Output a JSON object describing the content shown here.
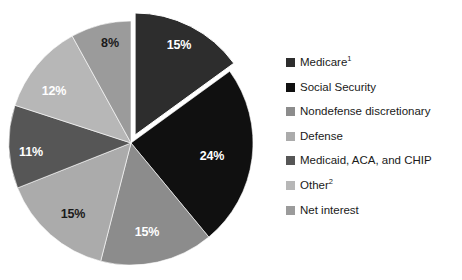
{
  "chart_data": {
    "type": "pie",
    "title": "",
    "subtitle": "",
    "xlabel": "",
    "ylabel": "",
    "legend_position": "right",
    "grid": false,
    "unit": "percent",
    "total": 100,
    "exploded_slices": [
      "Medicare"
    ],
    "categories": [
      "Medicare",
      "Social Security",
      "Nondefense discretionary",
      "Defense",
      "Medicaid, ACA, and CHIP",
      "Other",
      "Net interest"
    ],
    "values": [
      15,
      24,
      15,
      15,
      11,
      12,
      8
    ],
    "data_labels": [
      "15%",
      "24%",
      "15%",
      "15%",
      "11%",
      "12%",
      "8%"
    ],
    "colors": [
      "#2d2d2d",
      "#101010",
      "#8c8c8c",
      "#ababab",
      "#565656",
      "#b7b7b7",
      "#9b9b9b"
    ],
    "label_text_colors": [
      "#ffffff",
      "#ffffff",
      "#ffffff",
      "#1a1a1a",
      "#ffffff",
      "#ffffff",
      "#1a1a1a"
    ],
    "slices": [
      {
        "name": "Medicare",
        "legend_label": "Medicare",
        "footnote_marker": "1",
        "value": 15,
        "data_label": "15%",
        "color": "#2d2d2d",
        "label_color": "#ffffff",
        "exploded": true,
        "label_x": 179,
        "label_y": 46
      },
      {
        "name": "Social Security",
        "legend_label": "Social Security",
        "footnote_marker": "",
        "value": 24,
        "data_label": "24%",
        "color": "#101010",
        "label_color": "#ffffff",
        "exploded": false,
        "label_x": 212,
        "label_y": 157
      },
      {
        "name": "Nondefense discretionary",
        "legend_label": "Nondefense discretionary",
        "footnote_marker": "",
        "value": 15,
        "data_label": "15%",
        "color": "#8c8c8c",
        "label_color": "#ffffff",
        "exploded": false,
        "label_x": 147,
        "label_y": 233
      },
      {
        "name": "Defense",
        "legend_label": "Defense",
        "footnote_marker": "",
        "value": 15,
        "data_label": "15%",
        "color": "#ababab",
        "label_color": "#1a1a1a",
        "exploded": false,
        "label_x": 73,
        "label_y": 215
      },
      {
        "name": "Medicaid, ACA, and CHIP",
        "legend_label": "Medicaid, ACA, and CHIP",
        "footnote_marker": "",
        "value": 11,
        "data_label": "11%",
        "color": "#565656",
        "label_color": "#ffffff",
        "exploded": false,
        "label_x": 31,
        "label_y": 153
      },
      {
        "name": "Other",
        "legend_label": "Other",
        "footnote_marker": "2",
        "value": 12,
        "data_label": "12%",
        "color": "#b7b7b7",
        "label_color": "#ffffff",
        "exploded": false,
        "label_x": 54,
        "label_y": 92
      },
      {
        "name": "Net interest",
        "legend_label": "Net interest",
        "footnote_marker": "",
        "value": 8,
        "data_label": "8%",
        "color": "#9b9b9b",
        "label_color": "#1a1a1a",
        "exploded": false,
        "label_x": 110,
        "label_y": 44
      }
    ]
  },
  "legend": {
    "items": [
      {
        "label": "Medicare",
        "sup": "1",
        "color": "#2d2d2d"
      },
      {
        "label": "Social Security",
        "sup": "",
        "color": "#101010"
      },
      {
        "label": "Nondefense discretionary",
        "sup": "",
        "color": "#8c8c8c"
      },
      {
        "label": "Defense",
        "sup": "",
        "color": "#ababab"
      },
      {
        "label": "Medicaid, ACA, and CHIP",
        "sup": "",
        "color": "#565656"
      },
      {
        "label": "Other",
        "sup": "2",
        "color": "#b7b7b7"
      },
      {
        "label": "Net interest",
        "sup": "",
        "color": "#9b9b9b"
      }
    ]
  }
}
